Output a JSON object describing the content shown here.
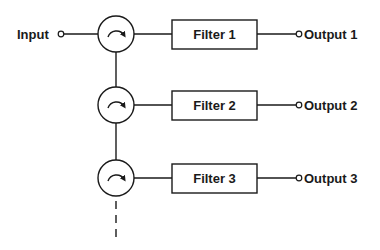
{
  "diagram": {
    "input_label": "Input",
    "stages": [
      {
        "filter_label": "Filter 1",
        "output_label": "Output 1"
      },
      {
        "filter_label": "Filter 2",
        "output_label": "Output 2"
      },
      {
        "filter_label": "Filter 3",
        "output_label": "Output 3"
      }
    ],
    "circulator_icon": "circulator-clockwise-arrow",
    "continuation": "dashed-line-down",
    "colors": {
      "stroke": "#1a1a1a",
      "background": "#ffffff"
    }
  }
}
